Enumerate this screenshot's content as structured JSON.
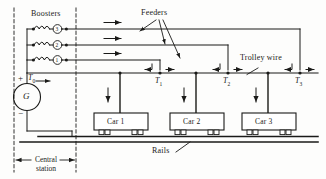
{
  "figure": {
    "type": "electrical-distribution-diagram",
    "title_text": "",
    "background": "#fdfdfc",
    "ink": "#1a1a18"
  },
  "labels": {
    "boosters": "Boosters",
    "feeders": "Feeders",
    "trolley_wire": "Trolley wire",
    "rails": "Rails",
    "central_station_line1": "Central",
    "central_station_line2": "station",
    "generator": "G",
    "plus": "+",
    "minus": "−"
  },
  "boosters": {
    "count": 3,
    "items": [
      {
        "number": "3",
        "row": 1
      },
      {
        "number": "2",
        "row": 2
      },
      {
        "number": "1",
        "row": 3
      }
    ]
  },
  "feeders": {
    "count": 3,
    "arrow_direction": "right",
    "leader_lines": 3
  },
  "terminals": [
    {
      "name": "T",
      "sub": "0",
      "label": "T₀"
    },
    {
      "name": "T",
      "sub": "1",
      "label": "T₁"
    },
    {
      "name": "T",
      "sub": "2",
      "label": "T₂"
    },
    {
      "name": "T",
      "sub": "3",
      "label": "T₃"
    }
  ],
  "cars": [
    {
      "label": "Car 1"
    },
    {
      "label": "Car 2"
    },
    {
      "label": "Car 3"
    }
  ],
  "trolley": {
    "pole_arrow_direction": "down",
    "junction_arrow_direction": "left-and-right"
  }
}
